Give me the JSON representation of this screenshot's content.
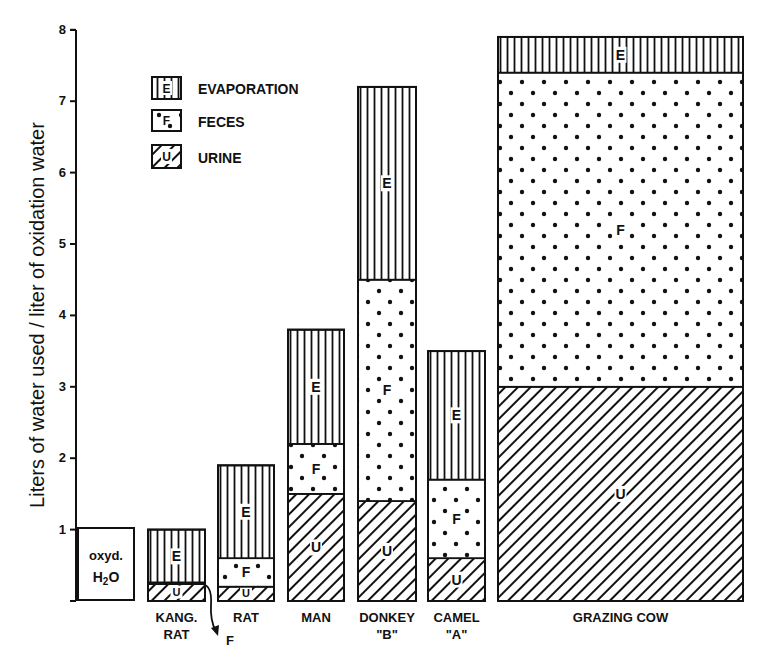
{
  "chart_data": {
    "type": "bar",
    "stacked": true,
    "title": "",
    "xlabel": "",
    "ylabel": "Liters of water used / liter of oxidation water",
    "ylim": [
      0,
      8
    ],
    "yticks": [
      "1",
      "2",
      "3",
      "4",
      "5",
      "6",
      "7",
      "8"
    ],
    "grid": false,
    "legend_position": "upper-left",
    "legend": [
      {
        "key": "E",
        "label": "EVAPORATION",
        "pattern": "vertical-lines"
      },
      {
        "key": "F",
        "label": "FECES",
        "pattern": "dots"
      },
      {
        "key": "U",
        "label": "URINE",
        "pattern": "diagonal-hatch"
      }
    ],
    "reference": {
      "label_line1": "oxyd.",
      "label_line2": "H2O",
      "value": 1.0
    },
    "categories": [
      "KANG. RAT",
      "RAT",
      "MAN",
      "DONKEY \"B\"",
      "CAMEL \"A\"",
      "GRAZING COW"
    ],
    "category_lines": [
      [
        "KANG.",
        "RAT"
      ],
      [
        "RAT"
      ],
      [
        "MAN"
      ],
      [
        "DONKEY",
        "\"B\""
      ],
      [
        "CAMEL",
        "\"A\""
      ],
      [
        "GRAZING COW"
      ]
    ],
    "series": [
      {
        "name": "URINE",
        "key": "U",
        "values": [
          0.25,
          0.2,
          1.5,
          1.4,
          0.6,
          3.0
        ]
      },
      {
        "name": "FECES",
        "key": "F",
        "values": [
          0.0,
          0.4,
          0.7,
          3.1,
          1.1,
          4.4
        ]
      },
      {
        "name": "EVAPORATION",
        "key": "E",
        "values": [
          0.75,
          1.3,
          1.6,
          2.7,
          1.8,
          0.5
        ]
      }
    ],
    "totals": [
      1.0,
      1.9,
      3.8,
      7.2,
      3.5,
      7.9
    ],
    "annotations": [
      {
        "text": "F",
        "target": "KANG. RAT",
        "note": "arrow pointing to thin feces layer"
      }
    ]
  }
}
